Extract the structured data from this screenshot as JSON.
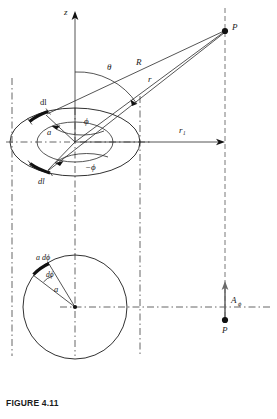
{
  "figure": {
    "caption": "FIGURE 4.11",
    "labels": {
      "z_axis": "z",
      "point_p_top": "P",
      "point_p_bottom": "P",
      "theta": "θ",
      "R": "R",
      "r": "r",
      "r_sub1": "r₁",
      "phi": "ϕ",
      "minus_phi": "−ϕ",
      "radius_a_top": "a",
      "dl_upper": "dl",
      "dl_lower": "dl",
      "a_dphi": "a dϕ",
      "dphi": "dϕ",
      "radius_a_bottom": "a",
      "A_phi": "A",
      "A_phi_sub": "ϕ"
    },
    "colors": {
      "ink": "#1a1a1a",
      "line": "#2a2a2a",
      "dashed": "#6a6a6a",
      "background": "#ffffff"
    },
    "geometry": {
      "origin": {
        "x": 75,
        "y": 142
      },
      "point_p": {
        "x": 225,
        "y": 31
      },
      "loop_center_top": {
        "x": 75,
        "y": 142
      },
      "loop_rx": 65,
      "loop_ry": 34,
      "circle_center_bottom": {
        "x": 75,
        "y": 307
      },
      "circle_radius": 52,
      "r1_length": 150
    }
  }
}
